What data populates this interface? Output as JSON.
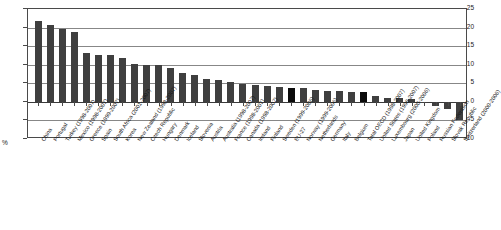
{
  "chart_data": {
    "type": "bar",
    "title": "",
    "subtitle": "",
    "xlabel": "",
    "ylabel": "%",
    "unit_label": "%",
    "ylim": [
      -10,
      25
    ],
    "yticks": [
      25,
      20,
      15,
      10,
      5,
      0,
      -5,
      -10
    ],
    "ytick_labels": [
      "25",
      "20",
      "15",
      "10",
      "5",
      "0",
      "-5",
      "-10"
    ],
    "grid": true,
    "grid_axis": "y",
    "legend": null,
    "legend_position": "none",
    "orientation": "vertical",
    "bar_color": "#3f3f3f",
    "highlight_color": "#0b0b0b",
    "axis_color": "#4a4a4a",
    "gridline_color": "#878787",
    "background_color": "#ffffff",
    "categories": [
      "China",
      "Portugal",
      "Turkey (1998-2007)",
      "Mexico (1998-2007)",
      "Greece (1999-2007)",
      "Spain",
      "South Africa (2001-2007)",
      "Korea",
      "New Zealand (1998-2007)",
      "Czech Republic",
      "Hungary",
      "Denmark",
      "Iceland",
      "Slovenia",
      "Austria",
      "Australia (1998-2007)",
      "France (1998-2007)",
      "Canada (1998-2007)",
      "Ireland",
      "Finland",
      "Sweden (1999-2006)",
      "EU-27",
      "Norway (1999-2006)",
      "Netherlands",
      "Germany",
      "Italy",
      "Belgium",
      "Total OECD (1998-2007)",
      "United States (1998-2007)",
      "Luxembourg (2000-2006)",
      "Japan",
      "United Kingdom",
      "Poland",
      "Russian Federation",
      "Slovak Republic",
      "Switzerland (2000-2006)"
    ],
    "values": [
      21.9,
      20.7,
      19.5,
      18.9,
      13.2,
      12.6,
      12.6,
      11.7,
      10.2,
      9.9,
      9.8,
      9.2,
      7.8,
      7.3,
      6.2,
      5.9,
      5.4,
      4.9,
      4.6,
      4.4,
      4.1,
      3.7,
      3.6,
      3.1,
      2.9,
      2.8,
      2.7,
      2.6,
      1.6,
      1.1,
      1.0,
      0.9,
      -0.3,
      -1.2,
      -2.0,
      -4.9
    ],
    "highlighted_categories": [
      "EU-27",
      "Total OECD (1998-2007)"
    ]
  }
}
